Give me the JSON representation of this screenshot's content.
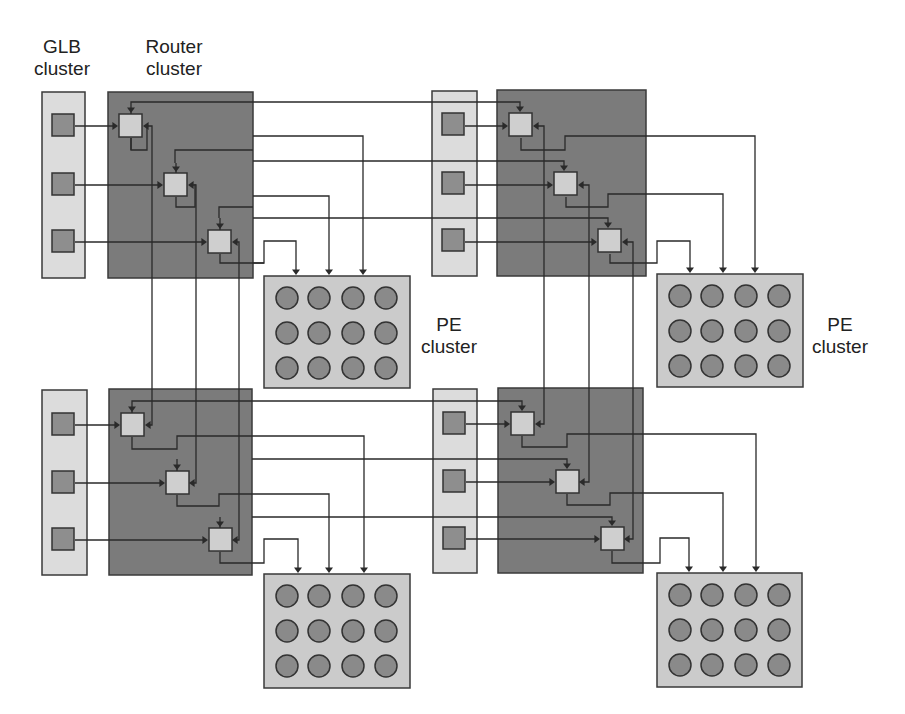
{
  "labels": {
    "glb": "GLB\ncluster",
    "router": "Router\ncluster",
    "pe_top_left": "PE\ncluster",
    "pe_top_right": "PE\ncluster"
  },
  "label_positions": {
    "glb": {
      "x": 28,
      "y": 36,
      "w": 68
    },
    "router": {
      "x": 136,
      "y": 36,
      "w": 76
    },
    "pe_top_left": {
      "x": 417,
      "y": 314,
      "w": 64
    },
    "pe_top_right": {
      "x": 808,
      "y": 314,
      "w": 64
    }
  },
  "colors": {
    "glb_fill": "#dcdcdc",
    "router_fill": "#7b7b7b",
    "switch_fill": "#cfcfcf",
    "pe_box_fill": "#cbcbcb",
    "pe_fill": "#8a8a8a",
    "wire": "#2a2a2a"
  },
  "tiles": [
    {
      "name": "top-left",
      "glb": {
        "x": 42,
        "y": 92,
        "w": 43,
        "h": 186
      },
      "router": {
        "x": 108,
        "y": 92,
        "w": 145,
        "h": 186
      },
      "glb_units": [
        {
          "x": 52,
          "y": 114
        },
        {
          "x": 52,
          "y": 173
        },
        {
          "x": 52,
          "y": 230
        }
      ],
      "switches": [
        {
          "x": 119,
          "y": 114
        },
        {
          "x": 164,
          "y": 173
        },
        {
          "x": 208,
          "y": 230
        }
      ],
      "pe": {
        "x": 264,
        "y": 276,
        "w": 146,
        "h": 112
      }
    },
    {
      "name": "top-right",
      "glb": {
        "x": 432,
        "y": 91,
        "w": 45,
        "h": 185
      },
      "router": {
        "x": 497,
        "y": 90,
        "w": 149,
        "h": 186
      },
      "glb_units": [
        {
          "x": 442,
          "y": 113
        },
        {
          "x": 442,
          "y": 172
        },
        {
          "x": 442,
          "y": 229
        }
      ],
      "switches": [
        {
          "x": 509,
          "y": 113
        },
        {
          "x": 554,
          "y": 172
        },
        {
          "x": 598,
          "y": 229
        }
      ],
      "pe": {
        "x": 657,
        "y": 274,
        "w": 146,
        "h": 113
      }
    },
    {
      "name": "bottom-left",
      "glb": {
        "x": 42,
        "y": 390,
        "w": 45,
        "h": 185
      },
      "router": {
        "x": 109,
        "y": 389,
        "w": 143,
        "h": 186
      },
      "glb_units": [
        {
          "x": 52,
          "y": 413
        },
        {
          "x": 52,
          "y": 471
        },
        {
          "x": 52,
          "y": 528
        }
      ],
      "switches": [
        {
          "x": 121,
          "y": 413
        },
        {
          "x": 166,
          "y": 471
        },
        {
          "x": 209,
          "y": 528
        }
      ],
      "pe": {
        "x": 264,
        "y": 574,
        "w": 146,
        "h": 114
      }
    },
    {
      "name": "bottom-right",
      "glb": {
        "x": 433,
        "y": 389,
        "w": 44,
        "h": 184
      },
      "router": {
        "x": 498,
        "y": 388,
        "w": 145,
        "h": 185
      },
      "glb_units": [
        {
          "x": 443,
          "y": 412
        },
        {
          "x": 443,
          "y": 470
        },
        {
          "x": 443,
          "y": 527
        }
      ],
      "switches": [
        {
          "x": 511,
          "y": 412
        },
        {
          "x": 556,
          "y": 470
        },
        {
          "x": 601,
          "y": 527
        }
      ],
      "pe": {
        "x": 657,
        "y": 573,
        "w": 145,
        "h": 114
      }
    }
  ],
  "unit_size": 22,
  "switch_size": 23,
  "pe_grid": {
    "cols": 4,
    "rows": 3,
    "dx": [
      23,
      55,
      89,
      122
    ],
    "dy": [
      22,
      57,
      92
    ],
    "r": 11
  },
  "wires": [
    "M 253 102 L 520 102 L 520 110",
    "M 131 138 L 131 150 L 147 150 L 147 126",
    "M 175 163 L 175 150 L 253 150",
    "M 253 136 L 363 136 L 363 273",
    "M 253 161 L 564 161 L 564 169",
    "M 176 197 L 176 207 L 195 207 L 195 184",
    "M 219 218 L 219 207 L 253 207",
    "M 253 196 L 329 196 L 329 273",
    "M 253 218 L 608 218 L 608 226",
    "M 220 254 L 220 263 L 264 263 L 264 241 L 296 241 L 296 273",
    "M 253 263 L 264 263",
    "M 131 138 L 131 150",
    "M 75 126 L 116 126",
    "M 75 185 L 161 185",
    "M 75 242 L 205 242",
    "M 131 114 L 131 102 L 253 102",
    "M 176 173 L 176 163",
    "M 220 230 L 220 218",
    "M 145 126 L 152 126 L 152 425 L 147 425",
    "M 189 185 L 196 185 L 196 483 L 191 483",
    "M 234 242 L 239 242 L 239 540 L 234 540",
    "M 465 126 L 506 126",
    "M 465 185 L 551 185",
    "M 465 242 L 595 242",
    "M 521 138 L 521 150 L 565 150 L 565 136 L 755 136 L 755 271",
    "M 566 197 L 566 207 L 608 207 L 608 194 L 723 194 L 723 271",
    "M 610 254 L 610 263 L 657 263 L 657 241 L 690 241 L 690 271",
    "M 535 126 L 544 126 L 544 424 L 537 424",
    "M 580 185 L 589 185 L 589 482 L 581 482",
    "M 624 242 L 633 242 L 633 539 L 626 539",
    "M 252 401 L 522 401 L 522 409",
    "M 132 437 L 132 449 L 177 449 L 177 436 L 252 436 L 364 436 L 364 571",
    "M 252 459 L 567 459 L 567 467",
    "M 177 495 L 177 506 L 219 506 L 219 494 L 252 494 L 329 494 L 329 571",
    "M 252 517 L 612 517 L 612 524",
    "M 220 552 L 220 563 L 264 563 L 264 539 L 298 539 L 298 571",
    "M 132 413 L 132 401 L 252 401",
    "M 177 471 L 177 459",
    "M 220 528 L 220 517",
    "M 75 425 L 118 425",
    "M 75 483 L 163 483",
    "M 75 540 L 206 540",
    "M 466 424 L 508 424",
    "M 466 482 L 553 482",
    "M 466 539 L 598 539",
    "M 522 436 L 522 447 L 567 447 L 567 434 L 756 434 L 756 570",
    "M 567 494 L 567 505 L 610 505 L 610 493 L 723 493 L 723 570",
    "M 612 551 L 612 563 L 660 563 L 660 538 L 689 538 L 689 570"
  ],
  "arrowheads": [
    {
      "x": 520,
      "y": 112,
      "dir": "down"
    },
    {
      "x": 564,
      "y": 171,
      "dir": "down"
    },
    {
      "x": 608,
      "y": 228,
      "dir": "down"
    },
    {
      "x": 131,
      "y": 113,
      "dir": "down"
    },
    {
      "x": 176,
      "y": 172,
      "dir": "down"
    },
    {
      "x": 220,
      "y": 229,
      "dir": "down"
    },
    {
      "x": 118,
      "y": 126,
      "dir": "right"
    },
    {
      "x": 163,
      "y": 185,
      "dir": "right"
    },
    {
      "x": 207,
      "y": 242,
      "dir": "right"
    },
    {
      "x": 143,
      "y": 126,
      "dir": "left"
    },
    {
      "x": 188,
      "y": 185,
      "dir": "left"
    },
    {
      "x": 232,
      "y": 242,
      "dir": "left"
    },
    {
      "x": 363,
      "y": 275,
      "dir": "down"
    },
    {
      "x": 329,
      "y": 275,
      "dir": "down"
    },
    {
      "x": 296,
      "y": 275,
      "dir": "down"
    },
    {
      "x": 508,
      "y": 126,
      "dir": "right"
    },
    {
      "x": 553,
      "y": 185,
      "dir": "right"
    },
    {
      "x": 597,
      "y": 242,
      "dir": "right"
    },
    {
      "x": 533,
      "y": 126,
      "dir": "left"
    },
    {
      "x": 578,
      "y": 185,
      "dir": "left"
    },
    {
      "x": 622,
      "y": 242,
      "dir": "left"
    },
    {
      "x": 755,
      "y": 273,
      "dir": "down"
    },
    {
      "x": 723,
      "y": 273,
      "dir": "down"
    },
    {
      "x": 690,
      "y": 273,
      "dir": "down"
    },
    {
      "x": 522,
      "y": 411,
      "dir": "down"
    },
    {
      "x": 567,
      "y": 469,
      "dir": "down"
    },
    {
      "x": 612,
      "y": 526,
      "dir": "down"
    },
    {
      "x": 132,
      "y": 412,
      "dir": "down"
    },
    {
      "x": 177,
      "y": 470,
      "dir": "down"
    },
    {
      "x": 220,
      "y": 527,
      "dir": "down"
    },
    {
      "x": 120,
      "y": 425,
      "dir": "right"
    },
    {
      "x": 165,
      "y": 483,
      "dir": "right"
    },
    {
      "x": 208,
      "y": 540,
      "dir": "right"
    },
    {
      "x": 145,
      "y": 425,
      "dir": "left"
    },
    {
      "x": 189,
      "y": 483,
      "dir": "left"
    },
    {
      "x": 232,
      "y": 540,
      "dir": "left"
    },
    {
      "x": 364,
      "y": 573,
      "dir": "down"
    },
    {
      "x": 329,
      "y": 573,
      "dir": "down"
    },
    {
      "x": 298,
      "y": 573,
      "dir": "down"
    },
    {
      "x": 510,
      "y": 424,
      "dir": "right"
    },
    {
      "x": 555,
      "y": 482,
      "dir": "right"
    },
    {
      "x": 600,
      "y": 539,
      "dir": "right"
    },
    {
      "x": 535,
      "y": 424,
      "dir": "left"
    },
    {
      "x": 579,
      "y": 482,
      "dir": "left"
    },
    {
      "x": 624,
      "y": 539,
      "dir": "left"
    },
    {
      "x": 756,
      "y": 572,
      "dir": "down"
    },
    {
      "x": 723,
      "y": 572,
      "dir": "down"
    },
    {
      "x": 689,
      "y": 572,
      "dir": "down"
    }
  ]
}
